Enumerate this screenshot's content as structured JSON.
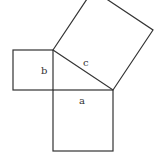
{
  "diagram": {
    "labels": {
      "a": "a",
      "b": "b",
      "c": "c"
    },
    "colors": {
      "stroke": "#333333",
      "background": "#ffffff"
    }
  }
}
